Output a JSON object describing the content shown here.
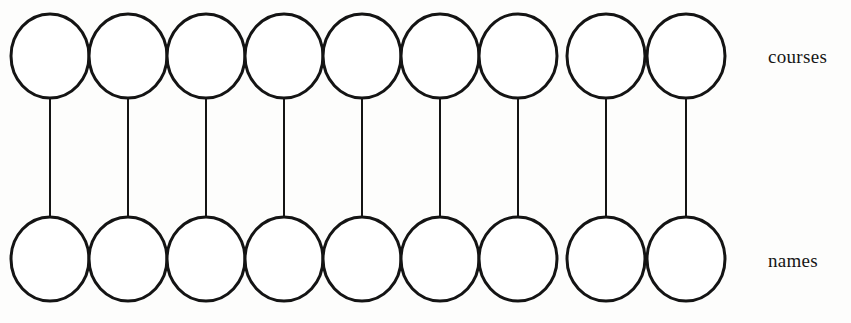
{
  "diagram": {
    "type": "bipartite-node-graph",
    "background_color": "#fdfdfc",
    "stroke_color": "#141414",
    "node_fill": "#ffffff",
    "node_count_per_row": 9,
    "edge_count": 9,
    "node_shape": "ellipse",
    "node_rx": 39,
    "node_ry": 42,
    "node_stroke_width": 3,
    "edge_stroke_width": 2,
    "first_node_center_x": 50,
    "node_spacing_x": 78,
    "top_row_center_y": 56,
    "bottom_row_center_y": 259,
    "rows": [
      {
        "id": "top-row",
        "label": "courses",
        "label_x": 768,
        "label_y": 46,
        "nodes": [
          {
            "index": 1,
            "cx": 50,
            "cy": 56
          },
          {
            "index": 2,
            "cx": 128,
            "cy": 56
          },
          {
            "index": 3,
            "cx": 206,
            "cy": 56
          },
          {
            "index": 4,
            "cx": 284,
            "cy": 56
          },
          {
            "index": 5,
            "cx": 362,
            "cy": 56
          },
          {
            "index": 6,
            "cx": 440,
            "cy": 56
          },
          {
            "index": 7,
            "cx": 518,
            "cy": 56
          },
          {
            "index": 8,
            "cx": 606,
            "cy": 56
          },
          {
            "index": 9,
            "cx": 686,
            "cy": 56
          }
        ]
      },
      {
        "id": "bottom-row",
        "label": "names",
        "label_x": 768,
        "label_y": 250,
        "nodes": [
          {
            "index": 1,
            "cx": 50,
            "cy": 259
          },
          {
            "index": 2,
            "cx": 128,
            "cy": 259
          },
          {
            "index": 3,
            "cx": 206,
            "cy": 259
          },
          {
            "index": 4,
            "cx": 284,
            "cy": 259
          },
          {
            "index": 5,
            "cx": 362,
            "cy": 259
          },
          {
            "index": 6,
            "cx": 440,
            "cy": 259
          },
          {
            "index": 7,
            "cx": 518,
            "cy": 259
          },
          {
            "index": 8,
            "cx": 606,
            "cy": 259
          },
          {
            "index": 9,
            "cx": 686,
            "cy": 259
          }
        ]
      }
    ],
    "edges": [
      {
        "index": 1,
        "x": 50,
        "y1": 98,
        "y2": 217
      },
      {
        "index": 2,
        "x": 128,
        "y1": 98,
        "y2": 217
      },
      {
        "index": 3,
        "x": 206,
        "y1": 98,
        "y2": 217
      },
      {
        "index": 4,
        "x": 284,
        "y1": 98,
        "y2": 217
      },
      {
        "index": 5,
        "x": 362,
        "y1": 98,
        "y2": 217
      },
      {
        "index": 6,
        "x": 440,
        "y1": 98,
        "y2": 217
      },
      {
        "index": 7,
        "x": 518,
        "y1": 98,
        "y2": 217
      },
      {
        "index": 8,
        "x": 606,
        "y1": 98,
        "y2": 217
      },
      {
        "index": 9,
        "x": 686,
        "y1": 98,
        "y2": 217
      }
    ]
  }
}
